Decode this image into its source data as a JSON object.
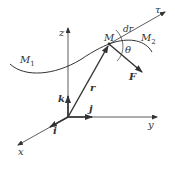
{
  "diagram": {
    "colors": {
      "stroke": "#333333",
      "background": "#ffffff"
    },
    "axes": {
      "x": {
        "label": "x"
      },
      "y": {
        "label": "y"
      },
      "z": {
        "label": "z"
      }
    },
    "unit_vectors": {
      "i": {
        "label": "i"
      },
      "j": {
        "label": "j"
      },
      "k": {
        "label": "k"
      }
    },
    "points": {
      "M": {
        "label": "M"
      },
      "M1": {
        "label": "M",
        "sub": "1"
      },
      "M2": {
        "label": "M",
        "sub": "2"
      }
    },
    "vectors": {
      "r": {
        "label": "r"
      },
      "F": {
        "label": "F"
      },
      "dr": {
        "label": "dr"
      },
      "tau": {
        "label": "τ"
      }
    },
    "angle": {
      "label": "θ"
    }
  }
}
